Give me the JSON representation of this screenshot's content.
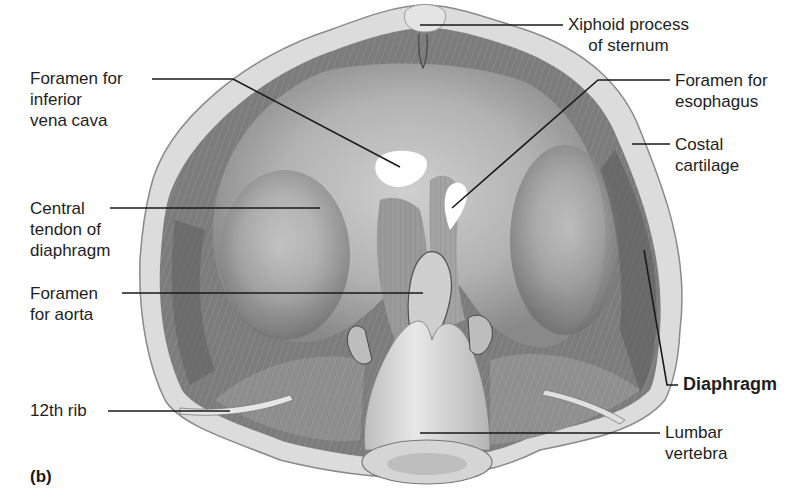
{
  "figure": {
    "panel_tag": "(b)",
    "colors": {
      "background": "#ffffff",
      "leader_line": "#1a1a1a",
      "muscle_dark": "#6e6e6e",
      "muscle_mid": "#9a9a9a",
      "tendon_light": "#d2d2d2",
      "cartilage": "#dedede",
      "foramen_hole": "#ffffff"
    }
  },
  "labels": {
    "ivc": {
      "line1": "Foramen for",
      "line2": "inferior",
      "line3": "vena cava"
    },
    "central_tendon": {
      "line1": "Central",
      "line2": "tendon of",
      "line3": "diaphragm"
    },
    "aorta": {
      "line1": "Foramen",
      "line2": "for aorta"
    },
    "rib12": {
      "line1": "12th rib"
    },
    "xiphoid": {
      "line1": "Xiphoid process",
      "line2": "of sternum"
    },
    "esophagus": {
      "line1": "Foramen for",
      "line2": "esophagus"
    },
    "costal": {
      "line1": "Costal",
      "line2": "cartilage"
    },
    "diaphragm": {
      "line1": "Diaphragm"
    },
    "lumbar": {
      "line1": "Lumbar",
      "line2": "vertebra"
    }
  }
}
